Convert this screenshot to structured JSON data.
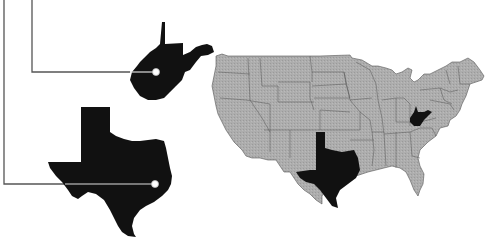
{
  "figure": {
    "type": "us-state-locator-map",
    "highlighted_states": [
      {
        "name": "West Virginia",
        "fill": "#111111",
        "callout_marker": {
          "x": 156,
          "y": 72
        }
      },
      {
        "name": "Texas",
        "fill": "#111111",
        "callout_marker": {
          "x": 155,
          "y": 184
        }
      }
    ],
    "base_map": {
      "region": "Contiguous United States",
      "fill": "#a9a9a9",
      "border": "#555555"
    },
    "leader_line_color": "#555555",
    "background": "#ffffff"
  }
}
